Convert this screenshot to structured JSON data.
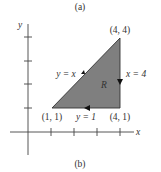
{
  "caption_top": "(a)",
  "caption_bottom": "(b)",
  "axes": {
    "x_label": "x",
    "y_label": "y"
  },
  "region": {
    "label": "R",
    "fill": "#7f7f7f",
    "vertices": [
      {
        "label": "(1, 1)",
        "x": 1,
        "y": 1
      },
      {
        "label": "(4, 4)",
        "x": 4,
        "y": 4
      },
      {
        "label": "(4, 1)",
        "x": 4,
        "y": 1
      }
    ]
  },
  "edges": [
    {
      "label": "y = x",
      "from": "(1, 1)",
      "to": "(4, 4)"
    },
    {
      "label": "x = 4",
      "from": "(4, 4)",
      "to": "(4, 1)"
    },
    {
      "label": "y = 1",
      "from": "(4, 1)",
      "to": "(1, 1)"
    }
  ]
}
